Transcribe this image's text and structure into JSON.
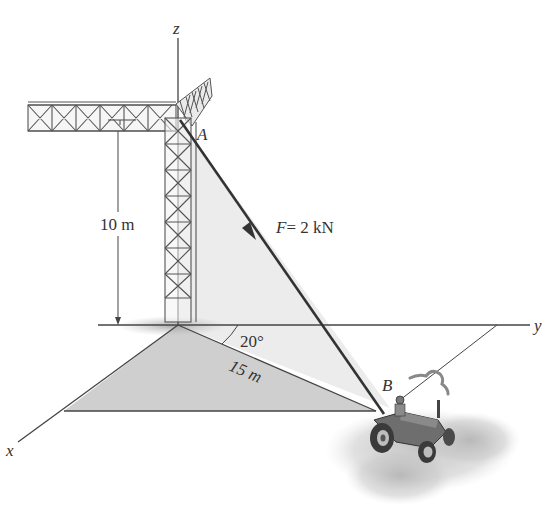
{
  "figure": {
    "type": "engineering statics diagram"
  },
  "axes": {
    "z_label": "z",
    "y_label": "y",
    "x_label": "x"
  },
  "points": {
    "A_label": "A",
    "B_label": "B"
  },
  "dimensions": {
    "height_label": "10 m",
    "distance_label": "15 m",
    "angle_label": "20°"
  },
  "force": {
    "symbol": "F",
    "equals": "= 2 kN"
  },
  "colors": {
    "line": "#333333",
    "shade_vertical": "#ececec",
    "shade_ground": "#cfcfcf",
    "background": "#ffffff"
  }
}
